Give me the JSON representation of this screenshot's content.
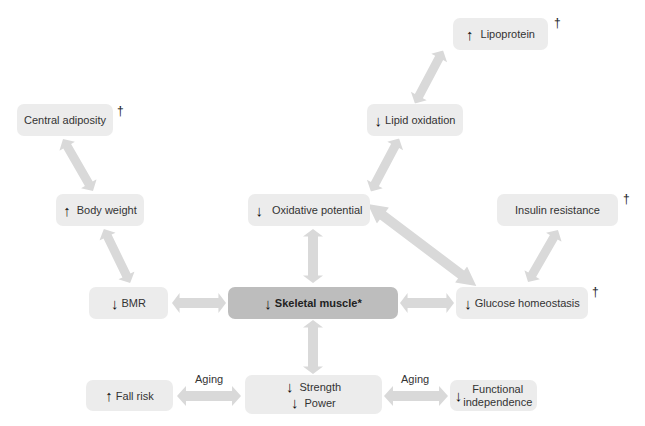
{
  "colors": {
    "node_fill": "#ececec",
    "central_node_fill": "#bdbdbd",
    "connector_fill": "#d9d9d9",
    "text": "#333333"
  },
  "nodes": {
    "lipoprotein": {
      "arrow": "↑",
      "label": "Lipoprotein",
      "dagger": "†"
    },
    "lipid_oxidation": {
      "arrow": "↓",
      "label": "Lipid oxidation"
    },
    "central_adiposity": {
      "label": "Central adiposity",
      "dagger": "†"
    },
    "body_weight": {
      "arrow": "↑",
      "label": "Body weight"
    },
    "oxidative_potential": {
      "arrow": "↓",
      "label": "Oxidative potential"
    },
    "insulin_resistance": {
      "label": "Insulin resistance",
      "dagger": "†"
    },
    "bmr": {
      "arrow": "↓",
      "label": "BMR"
    },
    "skeletal_muscle": {
      "arrow": "↓",
      "label": "Skeletal muscle*"
    },
    "glucose_homeostasis": {
      "arrow": "↓",
      "label": "Glucose homeostasis",
      "dagger": "†"
    },
    "fall_risk": {
      "arrow": "↑",
      "label": "Fall risk"
    },
    "strength_power": {
      "arrow1": "↓",
      "label1": "Strength",
      "arrow2": "↓",
      "label2": "Power"
    },
    "functional_independence": {
      "arrow": "↓",
      "line1": "Functional",
      "line2": "independence"
    }
  },
  "edge_labels": {
    "aging_left": "Aging",
    "aging_right": "Aging"
  },
  "edges": [
    {
      "from": "lipid_oxidation",
      "to": "lipoprotein",
      "type": "bidirectional"
    },
    {
      "from": "oxidative_potential",
      "to": "lipid_oxidation",
      "type": "bidirectional"
    },
    {
      "from": "central_adiposity",
      "to": "body_weight",
      "type": "bidirectional"
    },
    {
      "from": "body_weight",
      "to": "bmr",
      "type": "bidirectional"
    },
    {
      "from": "bmr",
      "to": "skeletal_muscle",
      "type": "bidirectional"
    },
    {
      "from": "oxidative_potential",
      "to": "skeletal_muscle",
      "type": "bidirectional"
    },
    {
      "from": "oxidative_potential",
      "to": "glucose_homeostasis",
      "type": "bidirectional"
    },
    {
      "from": "skeletal_muscle",
      "to": "glucose_homeostasis",
      "type": "bidirectional"
    },
    {
      "from": "glucose_homeostasis",
      "to": "insulin_resistance",
      "type": "bidirectional"
    },
    {
      "from": "skeletal_muscle",
      "to": "strength_power",
      "type": "bidirectional"
    },
    {
      "from": "strength_power",
      "to": "fall_risk",
      "type": "bidirectional",
      "label": "Aging"
    },
    {
      "from": "strength_power",
      "to": "functional_independence",
      "type": "bidirectional",
      "label": "Aging"
    }
  ]
}
